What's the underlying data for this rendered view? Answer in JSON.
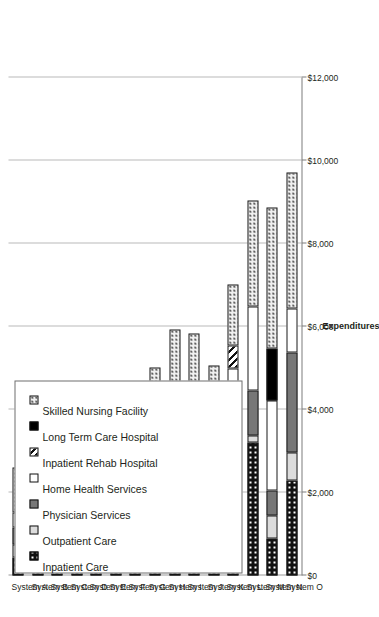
{
  "chart_data": {
    "type": "bar",
    "orientation": "vertical-stacked",
    "title": "",
    "xlabel": "",
    "ylabel": "Expenditures",
    "ylim": [
      0,
      12000
    ],
    "yticks": [
      "$0",
      "$2,000",
      "$4,000",
      "$6,000",
      "$8,000",
      "$10,000",
      "$12,000"
    ],
    "ytick_values": [
      0,
      2000,
      4000,
      6000,
      8000,
      10000,
      12000
    ],
    "grid": "major-y",
    "legend_position": "top-left",
    "categories": [
      "System A",
      "System B",
      "System C",
      "System D",
      "System E",
      "System F",
      "System G",
      "System H",
      "System I",
      "System J",
      "System K",
      "System L",
      "System M",
      "System N",
      "System O"
    ],
    "series": [
      {
        "name": "Inpatient Care",
        "pattern": "p-inpatient",
        "values": [
          430,
          1100,
          1150,
          1080,
          1690,
          620,
          560,
          1180,
          1230,
          2050,
          1870,
          2120,
          3200,
          880,
          2280
        ]
      },
      {
        "name": "Outpatient Care",
        "pattern": "p-outpatient",
        "values": [
          310,
          290,
          360,
          390,
          330,
          290,
          290,
          0,
          0,
          650,
          450,
          330,
          170,
          560,
          680
        ]
      },
      {
        "name": "Physician Services",
        "pattern": "p-physician",
        "values": [
          420,
          620,
          480,
          690,
          370,
          420,
          0,
          760,
          750,
          580,
          920,
          760,
          1080,
          620,
          2410
        ]
      },
      {
        "name": "Home Health Services",
        "pattern": "p-home",
        "values": [
          360,
          330,
          1100,
          0,
          1180,
          1620,
          2810,
          1800,
          2080,
          700,
          0,
          1780,
          2030,
          2160,
          1060
        ]
      },
      {
        "name": "Inpatient Rehab Hospital",
        "pattern": "p-rehab",
        "values": [
          0,
          0,
          0,
          0,
          0,
          310,
          0,
          0,
          290,
          0,
          0,
          560,
          0,
          0,
          0
        ]
      },
      {
        "name": "Long Term Care Hospital",
        "pattern": "p-ltch",
        "values": [
          0,
          0,
          240,
          0,
          0,
          0,
          0,
          0,
          0,
          0,
          0,
          0,
          0,
          1240,
          0
        ]
      },
      {
        "name": "Skilled Nursing Facility",
        "pattern": "p-snf",
        "values": [
          1080,
          1310,
          1140,
          1190,
          1010,
          1120,
          0,
          1280,
          1580,
          1860,
          1810,
          1460,
          2550,
          3420,
          3280
        ]
      }
    ],
    "totals": [
      2600,
      3650,
      4470,
      3350,
      4580,
      4380,
      3660,
      5020,
      5930,
      5840,
      5050,
      7010,
      9030,
      8880,
      9710
    ]
  },
  "legend": {
    "items": [
      {
        "label": "Inpatient Care",
        "swatch": "p-inpatient"
      },
      {
        "label": "Outpatient Care",
        "swatch": "p-outpatient"
      },
      {
        "label": "Physician Services",
        "swatch": "p-physician"
      },
      {
        "label": "Home Health Services",
        "swatch": "p-home"
      },
      {
        "label": "Inpatient Rehab Hospital",
        "swatch": "p-rehab"
      },
      {
        "label": "Long Term Care Hospital",
        "swatch": "p-ltch"
      },
      {
        "label": "Skilled Nursing Facility",
        "swatch": "p-snf"
      }
    ]
  },
  "axis": {
    "value_axis_title": "Expenditures"
  }
}
